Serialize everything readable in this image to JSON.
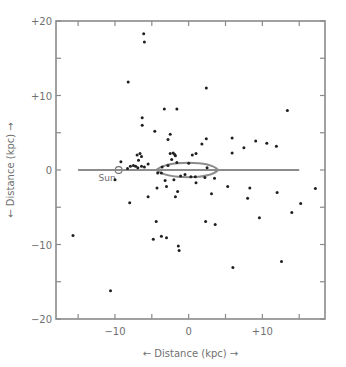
{
  "chart_data": {
    "type": "scatter",
    "title": "",
    "xlabel": "← Distance (kpc) →",
    "ylabel": "← Distance (kpc) →",
    "xlim": [
      -18,
      18.5
    ],
    "ylim": [
      -20,
      20
    ],
    "x_ticks": [
      {
        "value": -10,
        "label": "−10"
      },
      {
        "value": 0,
        "label": "0"
      },
      {
        "value": 10,
        "label": "+10"
      }
    ],
    "x_minor_ticks": [
      -15,
      -5,
      5,
      15
    ],
    "y_ticks": [
      {
        "value": 20,
        "label": "+20"
      },
      {
        "value": 10,
        "label": "+10"
      },
      {
        "value": 0,
        "label": "0"
      },
      {
        "value": -10,
        "label": "−10"
      },
      {
        "value": -20,
        "label": "−20"
      }
    ],
    "y_minor_ticks": [
      15,
      5,
      -5,
      -15
    ],
    "grid": false,
    "annotations": [
      {
        "type": "sun-marker",
        "label": "Sun",
        "x": -9.5,
        "y": 0
      },
      {
        "type": "galactic-disk-line",
        "x_start": -15,
        "x_end": 15,
        "y": 0
      },
      {
        "type": "galactic-bulge-ellipse",
        "cx": 0,
        "cy": 0,
        "rx": 4,
        "ry": 0.8
      }
    ],
    "series": [
      {
        "name": "Globular clusters",
        "points": [
          [
            -6.1,
            18.3
          ],
          [
            -6.0,
            17.2
          ],
          [
            -8.2,
            11.8
          ],
          [
            2.4,
            11.0
          ],
          [
            -6.3,
            7.0
          ],
          [
            -6.3,
            6.0
          ],
          [
            -3.3,
            8.2
          ],
          [
            -1.6,
            8.2
          ],
          [
            13.4,
            8.0
          ],
          [
            -4.6,
            5.2
          ],
          [
            -2.5,
            4.8
          ],
          [
            -2.8,
            4.1
          ],
          [
            1.8,
            3.5
          ],
          [
            2.4,
            4.2
          ],
          [
            5.9,
            2.3
          ],
          [
            7.5,
            3.0
          ],
          [
            9.1,
            3.9
          ],
          [
            10.6,
            3.6
          ],
          [
            11.9,
            3.2
          ],
          [
            5.9,
            4.3
          ],
          [
            -7.0,
            2.0
          ],
          [
            -6.6,
            2.2
          ],
          [
            -6.4,
            1.8
          ],
          [
            -6.8,
            1.3
          ],
          [
            -2.5,
            2.2
          ],
          [
            -2.1,
            2.3
          ],
          [
            -1.8,
            1.9
          ],
          [
            -2.3,
            1.4
          ],
          [
            -1.6,
            1.0
          ],
          [
            -1.9,
            2.1
          ],
          [
            0.5,
            2.0
          ],
          [
            1.0,
            2.2
          ],
          [
            -7.5,
            0.6
          ],
          [
            -7.9,
            0.5
          ],
          [
            -8.3,
            0.2
          ],
          [
            -7.2,
            0.5
          ],
          [
            -6.9,
            0.3
          ],
          [
            -6.4,
            0.5
          ],
          [
            -6.0,
            0.4
          ],
          [
            -5.5,
            0.8
          ],
          [
            -3.6,
            0.4
          ],
          [
            -2.8,
            0.6
          ],
          [
            0.0,
            0.9
          ],
          [
            2.5,
            0.3
          ],
          [
            -9.2,
            1.1
          ],
          [
            -10.0,
            -1.3
          ],
          [
            -4.2,
            -0.4
          ],
          [
            -3.7,
            -0.4
          ],
          [
            -3.2,
            -1.4
          ],
          [
            -2.0,
            -1.3
          ],
          [
            -1.1,
            -0.8
          ],
          [
            -0.5,
            -0.6
          ],
          [
            0.3,
            -0.9
          ],
          [
            0.9,
            -0.9
          ],
          [
            2.2,
            -1.0
          ],
          [
            1.0,
            -1.7
          ],
          [
            3.5,
            -1.1
          ],
          [
            -4.3,
            -2.4
          ],
          [
            -3.0,
            -2.2
          ],
          [
            -1.5,
            -2.9
          ],
          [
            -1.8,
            -3.6
          ],
          [
            3.1,
            -3.2
          ],
          [
            5.3,
            -2.2
          ],
          [
            8.0,
            -3.8
          ],
          [
            8.3,
            -2.4
          ],
          [
            12.0,
            -3.0
          ],
          [
            -8.0,
            -4.4
          ],
          [
            -5.5,
            -3.6
          ],
          [
            -4.4,
            -6.9
          ],
          [
            -3.7,
            -8.9
          ],
          [
            -3.0,
            -9.1
          ],
          [
            2.3,
            -6.9
          ],
          [
            3.6,
            -7.3
          ],
          [
            9.6,
            -6.4
          ],
          [
            15.2,
            -4.5
          ],
          [
            17.2,
            -2.5
          ],
          [
            14.0,
            -5.7
          ],
          [
            -15.7,
            -8.8
          ],
          [
            -1.4,
            -10.2
          ],
          [
            -1.3,
            -10.8
          ],
          [
            6.0,
            -13.1
          ],
          [
            12.6,
            -12.3
          ],
          [
            -10.6,
            -16.2
          ],
          [
            -4.8,
            -9.3
          ]
        ]
      }
    ]
  },
  "caption": "Figure caption (faded, illegible)"
}
